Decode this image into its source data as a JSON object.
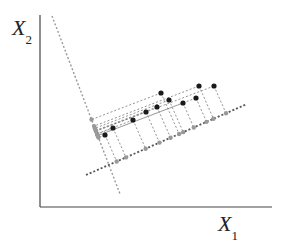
{
  "diagram": {
    "type": "pca-projection",
    "axes": {
      "x_label": "X",
      "x_sub": "1",
      "y_label": "X",
      "y_sub": "2",
      "origin": [
        40,
        207
      ],
      "x_end": [
        272,
        207
      ],
      "y_end": [
        40,
        15
      ]
    },
    "principal_line": {
      "from": [
        86,
        175
      ],
      "to": [
        247,
        104
      ],
      "color": "#555555"
    },
    "secondary_line": {
      "from": [
        52,
        16
      ],
      "to": [
        120,
        194
      ],
      "color": "#999999"
    },
    "points": [
      [
        105,
        135
      ],
      [
        113,
        128
      ],
      [
        133,
        120
      ],
      [
        146,
        112
      ],
      [
        157,
        107
      ],
      [
        161,
        93
      ],
      [
        169,
        100
      ],
      [
        183,
        103
      ],
      [
        196,
        98
      ],
      [
        199,
        86
      ],
      [
        214,
        86
      ]
    ],
    "colors": {
      "point": "#1a1a1a",
      "projection": "#999999",
      "axis": "#444444",
      "guide": "#777777"
    }
  }
}
